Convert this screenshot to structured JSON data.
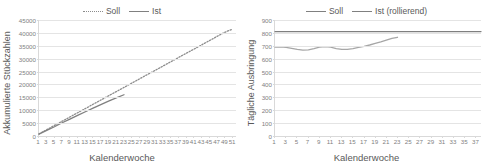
{
  "chart_data": [
    {
      "id": "left",
      "type": "line",
      "title": "",
      "xlabel": "Kalenderwoche",
      "ylabel": "Akkumulierte Stückzahlen",
      "xlim": [
        1,
        52
      ],
      "ylim": [
        0,
        45000
      ],
      "yticks": [
        0,
        5000,
        10000,
        15000,
        20000,
        25000,
        30000,
        35000,
        40000,
        45000
      ],
      "ytick_labels": [
        "0",
        "5000",
        "10000",
        "15000",
        "20000",
        "25000",
        "30000",
        "35000",
        "40000",
        "45000"
      ],
      "xticks": [
        1,
        3,
        5,
        7,
        9,
        11,
        13,
        15,
        17,
        19,
        21,
        23,
        25,
        27,
        29,
        31,
        33,
        35,
        37,
        39,
        41,
        43,
        45,
        47,
        49,
        51
      ],
      "grid": true,
      "legend_position": "top",
      "series": [
        {
          "name": "Soll",
          "style": "dotted",
          "color": "#8c8c8c",
          "x": [
            1,
            3,
            5,
            7,
            9,
            11,
            13,
            15,
            17,
            19,
            21,
            23,
            25,
            27,
            29,
            31,
            33,
            35,
            37,
            39,
            41,
            43,
            45,
            47,
            49,
            51
          ],
          "values": [
            820,
            2450,
            4100,
            5750,
            7380,
            9020,
            10650,
            12300,
            13950,
            15580,
            17200,
            18850,
            20500,
            22150,
            23780,
            25400,
            27050,
            28700,
            30350,
            31980,
            33600,
            35250,
            36900,
            38550,
            40180,
            41400
          ]
        },
        {
          "name": "Ist",
          "style": "solid",
          "color": "#808080",
          "x": [
            1,
            3,
            5,
            7,
            9,
            11,
            13,
            15,
            17,
            19,
            21,
            23
          ],
          "values": [
            700,
            2150,
            3600,
            5150,
            6550,
            8000,
            9400,
            10800,
            12150,
            13500,
            14800,
            16000
          ]
        }
      ]
    },
    {
      "id": "right",
      "type": "line",
      "title": "",
      "xlabel": "Kalenderwoche",
      "ylabel": "Tägliche Ausbringung",
      "xlim": [
        1,
        38
      ],
      "ylim": [
        0,
        900
      ],
      "yticks": [
        0,
        100,
        200,
        300,
        400,
        500,
        600,
        700,
        800,
        900
      ],
      "ytick_labels": [
        "0",
        "100",
        "200",
        "300",
        "400",
        "500",
        "600",
        "700",
        "800",
        "900"
      ],
      "xticks": [
        1,
        3,
        5,
        7,
        9,
        11,
        13,
        15,
        17,
        19,
        21,
        23,
        25,
        27,
        29,
        31,
        33,
        35,
        37
      ],
      "grid": true,
      "legend_position": "top",
      "series": [
        {
          "name": "Soll",
          "style": "solid",
          "color": "#7f7f7f",
          "x": [
            1,
            38
          ],
          "values": [
            810,
            810
          ]
        },
        {
          "name": "Ist (rollierend)",
          "style": "solid",
          "color": "#a6a6a6",
          "x": [
            1,
            2,
            3,
            4,
            5,
            6,
            7,
            8,
            9,
            10,
            11,
            12,
            13,
            14,
            15,
            16,
            17,
            18,
            19,
            20,
            21,
            22,
            23
          ],
          "values": [
            690,
            692,
            688,
            680,
            672,
            666,
            668,
            678,
            690,
            694,
            690,
            678,
            672,
            672,
            678,
            688,
            696,
            706,
            718,
            730,
            744,
            758,
            766
          ]
        }
      ]
    }
  ]
}
